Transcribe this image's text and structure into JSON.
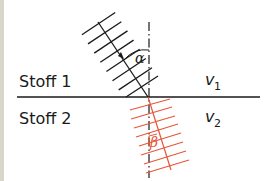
{
  "diagram": {
    "type": "wave-refraction",
    "medium_top": {
      "label": "Stoff 1",
      "velocity_symbol": "v",
      "velocity_subscript": "1"
    },
    "medium_bottom": {
      "label": "Stoff 2",
      "velocity_symbol": "v",
      "velocity_subscript": "2"
    },
    "angle_incidence": "α",
    "angle_refraction": "β",
    "colors": {
      "incident": "#1a1a1a",
      "refracted": "#e8553a",
      "interface": "#1a1a1a",
      "normal": "#1a1a1a",
      "left_strip": "#d8d6c8"
    }
  }
}
